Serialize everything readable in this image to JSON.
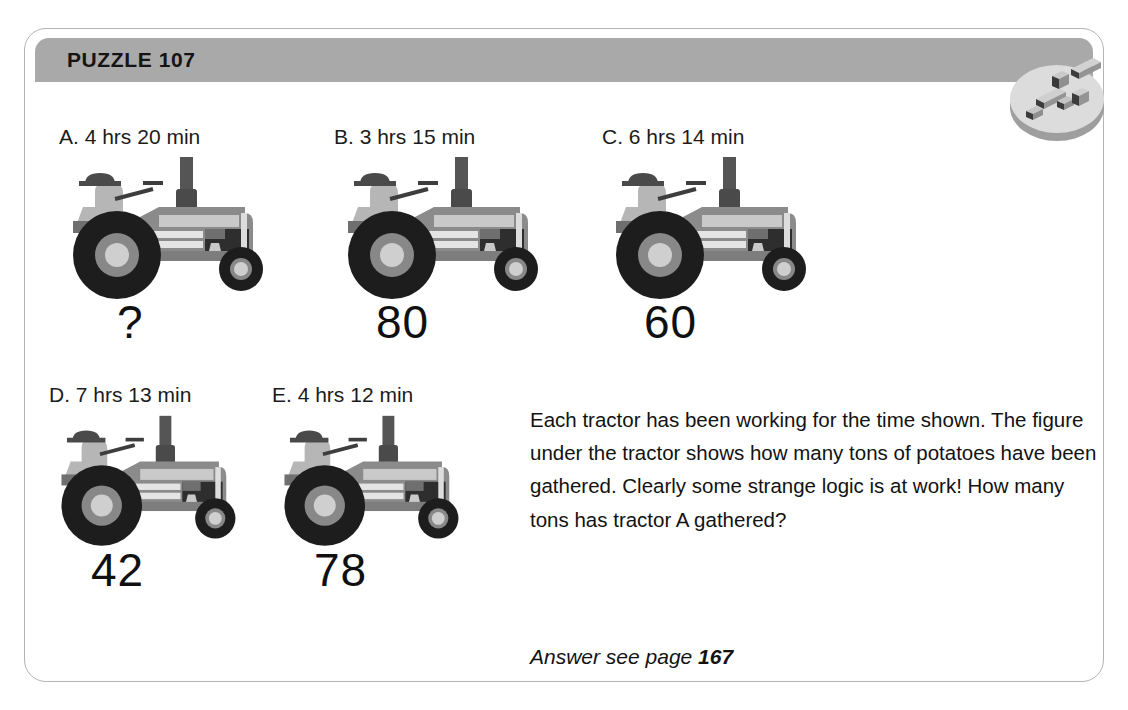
{
  "card": {
    "header": {
      "title": "PUZZLE 107",
      "band_color": "#a9a9a9",
      "title_color": "#141414"
    },
    "badge": {
      "icon": "isometric-blocks-badge-icon",
      "disc_color": "#d6d6d6",
      "block_color": "#9a9a9a"
    },
    "border_color": "#b4b4b4",
    "background_color": "#ffffff"
  },
  "tractors": [
    {
      "id": "A",
      "label": "A. 4 hrs 20 min",
      "value": "?",
      "hours": 4,
      "minutes": 20
    },
    {
      "id": "B",
      "label": "B. 3 hrs 15 min",
      "value": "80",
      "hours": 3,
      "minutes": 15
    },
    {
      "id": "C",
      "label": "C. 6 hrs 14 min",
      "value": "60",
      "hours": 6,
      "minutes": 14
    },
    {
      "id": "D",
      "label": "D. 7 hrs 13 min",
      "value": "42",
      "hours": 7,
      "minutes": 13
    },
    {
      "id": "E",
      "label": "E. 4 hrs 12 min",
      "value": "78",
      "hours": 4,
      "minutes": 12
    }
  ],
  "description": "Each tractor has been working for the time shown. The figure under the tractor shows how many tons of potatoes have been gathered. Clearly some strange logic is at work! How many tons has tractor A gathered?",
  "answer": {
    "prefix": "Answer see page ",
    "page": "167"
  },
  "tractor_colors": {
    "body": "#8b8b8b",
    "body_dark": "#6f6f6f",
    "panel_light": "#c9c9c9",
    "tire": "#1d1d1d",
    "rim": "#888888",
    "hub": "#cfcfcf",
    "driver": "#b6b6b6",
    "cap": "#4a4a4a",
    "stack": "#555555"
  }
}
